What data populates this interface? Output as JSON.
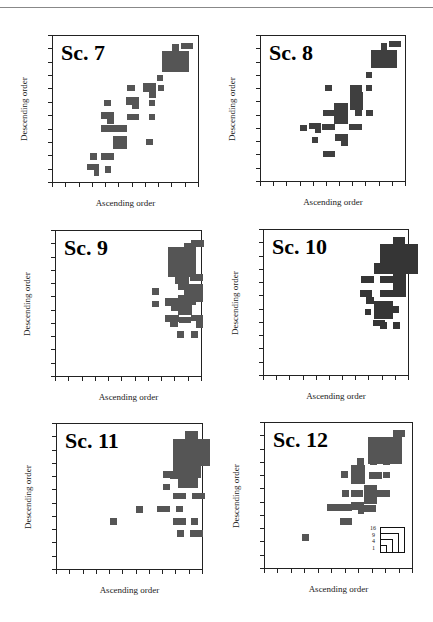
{
  "figure": {
    "x_axis_label": "Ascending order",
    "y_axis_label": "Descending order"
  },
  "chart_data": [
    {
      "type": "heatmap",
      "title": "Sc. 7",
      "xlabel": "Ascending order",
      "ylabel": "Descending order",
      "grid": false,
      "ticks_per_axis": 11,
      "frame": {
        "left": 52,
        "top": 35,
        "width": 147,
        "height": 148
      },
      "color": "#555555",
      "rects": [
        [
          109,
          15,
          27,
          21
        ],
        [
          119,
          8,
          7,
          7
        ],
        [
          128,
          7,
          12,
          6
        ],
        [
          104,
          39,
          6,
          6
        ],
        [
          90,
          47,
          13,
          9
        ],
        [
          96,
          56,
          7,
          6
        ],
        [
          105,
          49,
          6,
          6
        ],
        [
          74,
          49,
          8,
          6
        ],
        [
          73,
          61,
          13,
          8
        ],
        [
          79,
          69,
          7,
          4
        ],
        [
          96,
          64,
          6,
          6
        ],
        [
          74,
          78,
          12,
          6
        ],
        [
          96,
          78,
          6,
          6
        ],
        [
          51,
          64,
          7,
          6
        ],
        [
          48,
          76,
          13,
          7
        ],
        [
          54,
          83,
          7,
          5
        ],
        [
          48,
          89,
          26,
          7
        ],
        [
          60,
          100,
          14,
          13
        ],
        [
          93,
          103,
          7,
          6
        ],
        [
          37,
          117,
          7,
          7
        ],
        [
          48,
          117,
          13,
          7
        ],
        [
          34,
          128,
          12,
          6
        ],
        [
          41,
          134,
          5,
          6
        ],
        [
          52,
          130,
          6,
          7
        ]
      ]
    },
    {
      "type": "heatmap",
      "title": "Sc. 8",
      "xlabel": "Ascending order",
      "ylabel": "Descending order",
      "grid": false,
      "ticks_per_axis": 11,
      "frame": {
        "left": 260,
        "top": 35,
        "width": 146,
        "height": 147
      },
      "color": "#3f3f3f",
      "rects": [
        [
          110,
          14,
          26,
          18
        ],
        [
          120,
          7,
          6,
          7
        ],
        [
          128,
          5,
          12,
          6
        ],
        [
          105,
          36,
          6,
          6
        ],
        [
          105,
          49,
          6,
          6
        ],
        [
          64,
          49,
          7,
          6
        ],
        [
          89,
          49,
          12,
          7
        ],
        [
          89,
          56,
          13,
          18
        ],
        [
          73,
          67,
          14,
          21
        ],
        [
          62,
          74,
          11,
          6
        ],
        [
          94,
          74,
          7,
          6
        ],
        [
          105,
          74,
          7,
          6
        ],
        [
          48,
          87,
          12,
          6
        ],
        [
          54,
          93,
          6,
          4
        ],
        [
          61,
          88,
          13,
          6
        ],
        [
          39,
          89,
          7,
          6
        ],
        [
          88,
          88,
          13,
          6
        ],
        [
          51,
          101,
          6,
          6
        ],
        [
          74,
          98,
          13,
          7
        ],
        [
          80,
          105,
          7,
          5
        ],
        [
          62,
          115,
          12,
          6
        ]
      ]
    },
    {
      "type": "heatmap",
      "title": "Sc. 9",
      "xlabel": "Ascending order",
      "ylabel": "Descending order",
      "grid": false,
      "ticks_per_axis": 11,
      "frame": {
        "left": 55,
        "top": 230,
        "width": 147,
        "height": 147
      },
      "color": "#555555",
      "rects": [
        [
          135,
          9,
          13,
          7
        ],
        [
          128,
          12,
          7,
          8
        ],
        [
          112,
          16,
          28,
          30
        ],
        [
          119,
          41,
          14,
          12
        ],
        [
          134,
          43,
          13,
          7
        ],
        [
          128,
          53,
          19,
          18
        ],
        [
          140,
          56,
          7,
          7
        ],
        [
          122,
          53,
          7,
          6
        ],
        [
          96,
          57,
          7,
          7
        ],
        [
          96,
          70,
          7,
          6
        ],
        [
          109,
          67,
          13,
          8
        ],
        [
          115,
          73,
          8,
          7
        ],
        [
          122,
          64,
          14,
          20
        ],
        [
          133,
          68,
          7,
          6
        ],
        [
          109,
          84,
          14,
          7
        ],
        [
          114,
          90,
          8,
          6
        ],
        [
          123,
          86,
          12,
          6
        ],
        [
          135,
          84,
          12,
          6
        ],
        [
          140,
          90,
          7,
          7
        ],
        [
          121,
          100,
          7,
          7
        ],
        [
          135,
          100,
          7,
          7
        ]
      ]
    },
    {
      "type": "heatmap",
      "title": "Sc. 10",
      "xlabel": "Ascending order",
      "ylabel": "Descending order",
      "grid": false,
      "ticks_per_axis": 11,
      "frame": {
        "left": 263,
        "top": 229,
        "width": 146,
        "height": 147
      },
      "color": "#353535",
      "rects": [
        [
          129,
          7,
          12,
          8
        ],
        [
          116,
          14,
          38,
          30
        ],
        [
          110,
          33,
          14,
          11
        ],
        [
          129,
          37,
          12,
          7
        ],
        [
          97,
          46,
          13,
          7
        ],
        [
          116,
          46,
          13,
          7
        ],
        [
          129,
          41,
          13,
          19
        ],
        [
          96,
          60,
          12,
          7
        ],
        [
          102,
          67,
          8,
          7
        ],
        [
          116,
          60,
          13,
          7
        ],
        [
          129,
          60,
          13,
          7
        ],
        [
          101,
          79,
          6,
          6
        ],
        [
          110,
          71,
          19,
          18
        ],
        [
          129,
          76,
          6,
          7
        ],
        [
          109,
          90,
          12,
          6
        ],
        [
          116,
          92,
          7,
          7
        ],
        [
          129,
          92,
          7,
          7
        ]
      ]
    },
    {
      "type": "heatmap",
      "title": "Sc. 11",
      "xlabel": "Ascending order",
      "ylabel": "Descending order",
      "grid": false,
      "ticks_per_axis": 11,
      "frame": {
        "left": 56,
        "top": 423,
        "width": 147,
        "height": 147
      },
      "color": "#555555",
      "rects": [
        [
          128,
          7,
          13,
          14
        ],
        [
          116,
          15,
          37,
          27
        ],
        [
          116,
          42,
          28,
          12
        ],
        [
          121,
          54,
          20,
          10
        ],
        [
          106,
          47,
          7,
          7
        ],
        [
          106,
          60,
          7,
          6
        ],
        [
          116,
          47,
          6,
          6
        ],
        [
          113,
          47,
          13,
          8
        ],
        [
          116,
          69,
          13,
          6
        ],
        [
          135,
          69,
          13,
          6
        ],
        [
          79,
          82,
          7,
          7
        ],
        [
          100,
          82,
          13,
          6
        ],
        [
          119,
          82,
          7,
          6
        ],
        [
          116,
          94,
          13,
          7
        ],
        [
          134,
          94,
          7,
          7
        ],
        [
          53,
          94,
          7,
          7
        ],
        [
          120,
          106,
          7,
          7
        ],
        [
          133,
          106,
          13,
          7
        ]
      ]
    },
    {
      "type": "heatmap",
      "title": "Sc. 12",
      "xlabel": "Ascending order",
      "ylabel": "Descending order",
      "grid": false,
      "ticks_per_axis": 11,
      "frame": {
        "left": 264,
        "top": 422,
        "width": 149,
        "height": 147
      },
      "color": "#555555",
      "rects": [
        [
          128,
          7,
          12,
          7
        ],
        [
          103,
          14,
          34,
          27
        ],
        [
          92,
          35,
          7,
          7
        ],
        [
          105,
          35,
          7,
          7
        ],
        [
          118,
          35,
          7,
          7
        ],
        [
          76,
          48,
          7,
          7
        ],
        [
          86,
          42,
          14,
          19
        ],
        [
          104,
          49,
          13,
          7
        ],
        [
          118,
          49,
          7,
          6
        ],
        [
          77,
          67,
          7,
          7
        ],
        [
          86,
          67,
          12,
          7
        ],
        [
          99,
          62,
          13,
          19
        ],
        [
          111,
          67,
          14,
          7
        ],
        [
          62,
          81,
          25,
          7
        ],
        [
          86,
          79,
          13,
          8
        ],
        [
          93,
          87,
          6,
          4
        ],
        [
          99,
          82,
          12,
          7
        ],
        [
          75,
          95,
          12,
          7
        ],
        [
          37,
          111,
          7,
          7
        ]
      ],
      "legend": {
        "labels": [
          "16",
          "9",
          "4",
          "1"
        ],
        "position": "bottom-right"
      }
    }
  ]
}
